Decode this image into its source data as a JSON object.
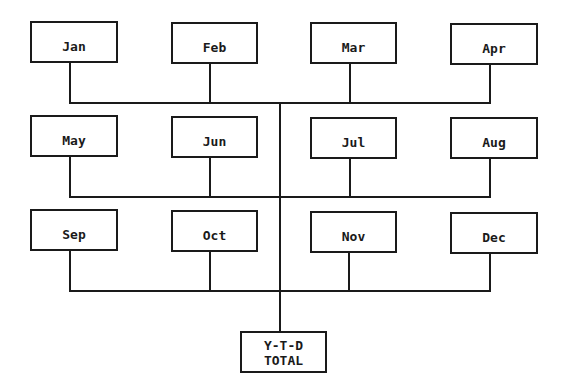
{
  "diagram": {
    "months": [
      "Jan",
      "Feb",
      "Mar",
      "Apr",
      "May",
      "Jun",
      "Jul",
      "Aug",
      "Sep",
      "Oct",
      "Nov",
      "Dec"
    ],
    "total": {
      "line1": "Y-T-D",
      "line2": "TOTAL"
    }
  }
}
